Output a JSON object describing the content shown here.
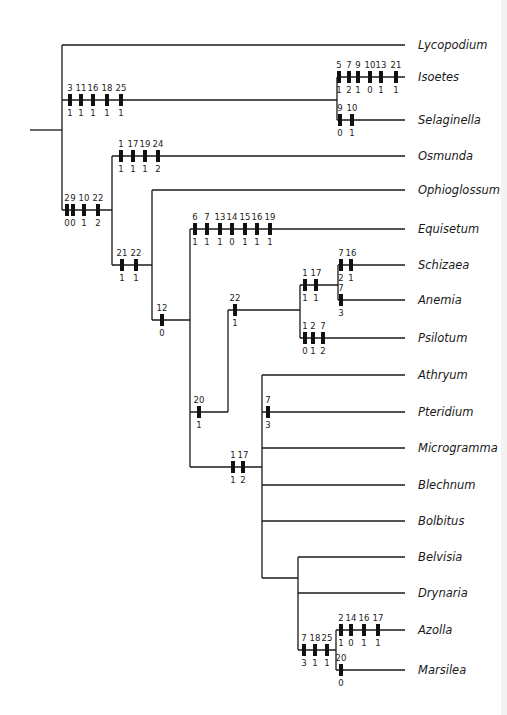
{
  "figure": {
    "type": "cladogram"
  },
  "taxa": [
    {
      "name": "Lycopodium",
      "y": 45
    },
    {
      "name": "Isoetes",
      "y": 77
    },
    {
      "name": "Selaginella",
      "y": 120
    },
    {
      "name": "Osmunda",
      "y": 156
    },
    {
      "name": "Ophioglossum",
      "y": 190
    },
    {
      "name": "Equisetum",
      "y": 229
    },
    {
      "name": "Schizaea",
      "y": 265
    },
    {
      "name": "Anemia",
      "y": 300
    },
    {
      "name": "Psilotum",
      "y": 338
    },
    {
      "name": "Athryum",
      "y": 375
    },
    {
      "name": "Pteridium",
      "y": 412
    },
    {
      "name": "Microgramma",
      "y": 448
    },
    {
      "name": "Blechnum",
      "y": 485
    },
    {
      "name": "Bolbitus",
      "y": 521
    },
    {
      "name": "Belvisia",
      "y": 557
    },
    {
      "name": "Drynaria",
      "y": 593
    },
    {
      "name": "Azolla",
      "y": 630
    },
    {
      "name": "Marsilea",
      "y": 670
    }
  ],
  "edges": [
    [
      30,
      130,
      62,
      130
    ],
    [
      62,
      45,
      62,
      210
    ],
    [
      62,
      45,
      405,
      45
    ],
    [
      62,
      100,
      337,
      100
    ],
    [
      337,
      77,
      337,
      120
    ],
    [
      337,
      77,
      405,
      77
    ],
    [
      337,
      120,
      405,
      120
    ],
    [
      62,
      210,
      112,
      210
    ],
    [
      112,
      156,
      112,
      265
    ],
    [
      112,
      156,
      405,
      156
    ],
    [
      112,
      265,
      152,
      265
    ],
    [
      152,
      190,
      152,
      320
    ],
    [
      152,
      190,
      405,
      190
    ],
    [
      152,
      320,
      190,
      320
    ],
    [
      190,
      229,
      190,
      467
    ],
    [
      190,
      229,
      405,
      229
    ],
    [
      190,
      412,
      228,
      412
    ],
    [
      228,
      310,
      228,
      412
    ],
    [
      228,
      310,
      300,
      310
    ],
    [
      300,
      285,
      300,
      338
    ],
    [
      300,
      285,
      338,
      285
    ],
    [
      338,
      265,
      338,
      300
    ],
    [
      338,
      265,
      405,
      265
    ],
    [
      338,
      300,
      405,
      300
    ],
    [
      300,
      338,
      405,
      338
    ],
    [
      190,
      467,
      262,
      467
    ],
    [
      262,
      375,
      262,
      578
    ],
    [
      262,
      375,
      405,
      375
    ],
    [
      262,
      412,
      405,
      412
    ],
    [
      262,
      448,
      405,
      448
    ],
    [
      262,
      485,
      405,
      485
    ],
    [
      262,
      521,
      405,
      521
    ],
    [
      262,
      578,
      298,
      578
    ],
    [
      298,
      557,
      298,
      650
    ],
    [
      298,
      557,
      405,
      557
    ],
    [
      298,
      593,
      405,
      593
    ],
    [
      298,
      650,
      336,
      650
    ],
    [
      336,
      630,
      336,
      670
    ],
    [
      336,
      630,
      405,
      630
    ],
    [
      336,
      670,
      405,
      670
    ]
  ],
  "character_changes": [
    {
      "branch": "Isoetes+Selaginella",
      "y": 100,
      "marks": [
        {
          "x": 70,
          "char": "3",
          "state": "1"
        },
        {
          "x": 81,
          "char": "11",
          "state": "1"
        },
        {
          "x": 93,
          "char": "16",
          "state": "1"
        },
        {
          "x": 107,
          "char": "18",
          "state": "1"
        },
        {
          "x": 121,
          "char": "25",
          "state": "1"
        }
      ]
    },
    {
      "branch": "Isoetes",
      "y": 77,
      "marks": [
        {
          "x": 339,
          "char": "5",
          "state": "1"
        },
        {
          "x": 349,
          "char": "7",
          "state": "2"
        },
        {
          "x": 358,
          "char": "9",
          "state": "1"
        },
        {
          "x": 370,
          "char": "10",
          "state": "0"
        },
        {
          "x": 381,
          "char": "13",
          "state": "1"
        },
        {
          "x": 396,
          "char": "21",
          "state": "1"
        }
      ]
    },
    {
      "branch": "Selaginella",
      "y": 120,
      "marks": [
        {
          "x": 340,
          "char": "9",
          "state": "0"
        },
        {
          "x": 352,
          "char": "10",
          "state": "1"
        }
      ]
    },
    {
      "branch": "Ferns+Equisetum+Psilotum",
      "y": 210,
      "marks": [
        {
          "x": 67,
          "char": "2",
          "state": "0"
        },
        {
          "x": 73,
          "char": "9",
          "state": "0"
        },
        {
          "x": 84,
          "char": "10",
          "state": "1"
        },
        {
          "x": 98,
          "char": "22",
          "state": "2"
        }
      ]
    },
    {
      "branch": "Osmunda",
      "y": 156,
      "marks": [
        {
          "x": 121,
          "char": "1",
          "state": "1"
        },
        {
          "x": 133,
          "char": "17",
          "state": "1"
        },
        {
          "x": 145,
          "char": "19",
          "state": "1"
        },
        {
          "x": 158,
          "char": "24",
          "state": "2"
        }
      ]
    },
    {
      "branch": "node-21-22",
      "y": 265,
      "marks": [
        {
          "x": 122,
          "char": "21",
          "state": "1"
        },
        {
          "x": 136,
          "char": "22",
          "state": "1"
        }
      ]
    },
    {
      "branch": "node-12",
      "y": 320,
      "marks": [
        {
          "x": 162,
          "char": "12",
          "state": "0"
        }
      ]
    },
    {
      "branch": "Equisetum",
      "y": 229,
      "marks": [
        {
          "x": 195,
          "char": "6",
          "state": "1"
        },
        {
          "x": 207,
          "char": "7",
          "state": "1"
        },
        {
          "x": 220,
          "char": "13",
          "state": "1"
        },
        {
          "x": 232,
          "char": "14",
          "state": "0"
        },
        {
          "x": 245,
          "char": "15",
          "state": "1"
        },
        {
          "x": 257,
          "char": "16",
          "state": "1"
        },
        {
          "x": 270,
          "char": "19",
          "state": "1"
        }
      ]
    },
    {
      "branch": "node-20",
      "y": 412,
      "marks": [
        {
          "x": 199,
          "char": "20",
          "state": "1"
        }
      ]
    },
    {
      "branch": "node-22",
      "y": 310,
      "marks": [
        {
          "x": 235,
          "char": "22",
          "state": "1"
        }
      ]
    },
    {
      "branch": "Schizaea+Anemia",
      "y": 285,
      "marks": [
        {
          "x": 305,
          "char": "1",
          "state": "1"
        },
        {
          "x": 316,
          "char": "17",
          "state": "1"
        }
      ]
    },
    {
      "branch": "Schizaea",
      "y": 265,
      "marks": [
        {
          "x": 341,
          "char": "7",
          "state": "2"
        },
        {
          "x": 351,
          "char": "16",
          "state": "1"
        }
      ]
    },
    {
      "branch": "Anemia",
      "y": 300,
      "marks": [
        {
          "x": 341,
          "char": "7",
          "state": "3"
        }
      ]
    },
    {
      "branch": "Psilotum",
      "y": 338,
      "marks": [
        {
          "x": 305,
          "char": "1",
          "state": "0"
        },
        {
          "x": 313,
          "char": "2",
          "state": "1"
        },
        {
          "x": 323,
          "char": "7",
          "state": "2"
        }
      ]
    },
    {
      "branch": "node-1-17",
      "y": 467,
      "marks": [
        {
          "x": 233,
          "char": "1",
          "state": "1"
        },
        {
          "x": 243,
          "char": "17",
          "state": "2"
        }
      ]
    },
    {
      "branch": "Pteridium",
      "y": 412,
      "marks": [
        {
          "x": 268,
          "char": "7",
          "state": "3"
        }
      ]
    },
    {
      "branch": "Azolla+Marsilea",
      "y": 650,
      "marks": [
        {
          "x": 304,
          "char": "7",
          "state": "3"
        },
        {
          "x": 315,
          "char": "18",
          "state": "1"
        },
        {
          "x": 327,
          "char": "25",
          "state": "1"
        }
      ]
    },
    {
      "branch": "Azolla",
      "y": 630,
      "marks": [
        {
          "x": 341,
          "char": "2",
          "state": "1"
        },
        {
          "x": 351,
          "char": "14",
          "state": "0"
        },
        {
          "x": 364,
          "char": "16",
          "state": "1"
        },
        {
          "x": 378,
          "char": "17",
          "state": "1"
        }
      ]
    },
    {
      "branch": "Marsilea",
      "y": 670,
      "marks": [
        {
          "x": 341,
          "char": "20",
          "state": "0"
        }
      ]
    }
  ],
  "colors": {
    "line": "#1a1a1a",
    "bar": "#111111",
    "text": "#1a1a1a",
    "background": "#ffffff"
  }
}
